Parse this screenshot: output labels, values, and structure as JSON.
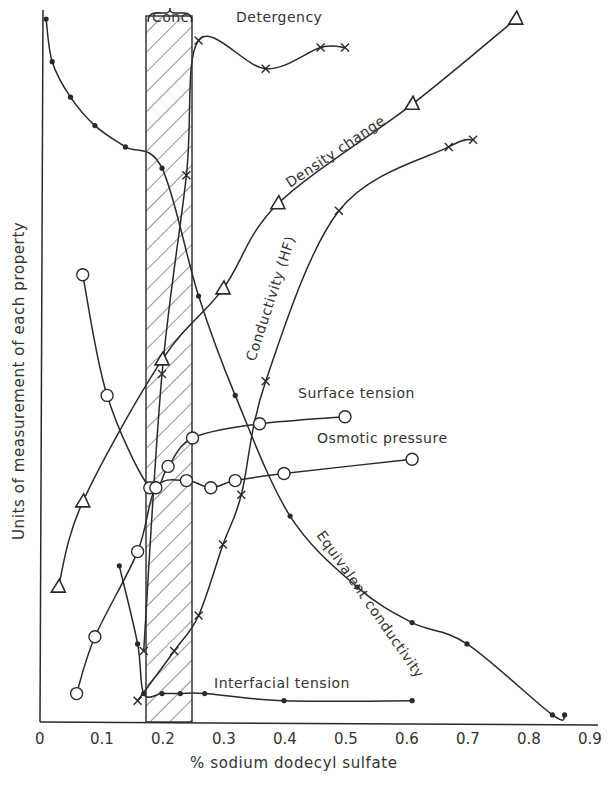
{
  "chart_data": {
    "type": "line",
    "title": "",
    "xlabel": "% sodium dodecyl sulfate",
    "ylabel": "Units of measurement of each property",
    "xlim": [
      0,
      0.9
    ],
    "ylim": [
      0,
      100
    ],
    "x_ticks": [
      "0",
      "0.1",
      "0.2",
      "0.3",
      "0.4",
      "0.5",
      "0.6",
      "0.7",
      "0.8",
      "0.9"
    ],
    "y_ticks": [],
    "grid": false,
    "legend": "inline curve labels",
    "annotations": [
      {
        "text": "Conc.",
        "type": "bracket",
        "x_range": [
          0.17,
          0.25
        ],
        "note": "hatched critical micelle concentration band"
      }
    ],
    "series": [
      {
        "name": "Detergency",
        "marker": "x",
        "x": [
          0.17,
          0.2,
          0.24,
          0.26,
          0.37,
          0.46,
          0.5
        ],
        "y": [
          10,
          49,
          77,
          96,
          92,
          95,
          95
        ]
      },
      {
        "name": "Density change",
        "marker": "triangle",
        "x": [
          0.03,
          0.07,
          0.2,
          0.3,
          0.39,
          0.61,
          0.78
        ],
        "y": [
          19,
          31,
          51,
          61,
          73,
          87,
          99
        ]
      },
      {
        "name": "Conductivity (HF)",
        "marker": "x",
        "x": [
          0.16,
          0.22,
          0.26,
          0.3,
          0.33,
          0.37,
          0.49,
          0.67,
          0.71
        ],
        "y": [
          3,
          10,
          15,
          25,
          32,
          48,
          72,
          81,
          82
        ]
      },
      {
        "name": "Surface tension",
        "marker": "circle",
        "x": [
          0.07,
          0.11,
          0.18,
          0.21,
          0.25,
          0.36,
          0.5
        ],
        "y": [
          63,
          46,
          33,
          36,
          40,
          42,
          43
        ]
      },
      {
        "name": "Osmotic pressure",
        "marker": "circle",
        "x": [
          0.06,
          0.09,
          0.16,
          0.19,
          0.24,
          0.28,
          0.32,
          0.4,
          0.61
        ],
        "y": [
          4,
          12,
          24,
          33,
          34,
          33,
          34,
          35,
          37
        ]
      },
      {
        "name": "Equivalent conductivity",
        "marker": "dot",
        "x": [
          0.01,
          0.02,
          0.05,
          0.09,
          0.14,
          0.2,
          0.26,
          0.32,
          0.41,
          0.52,
          0.61,
          0.7,
          0.84,
          0.86
        ],
        "y": [
          99,
          93,
          88,
          84,
          81,
          78,
          60,
          46,
          29,
          19,
          14,
          11,
          1,
          1
        ]
      },
      {
        "name": "Interfacial tension",
        "marker": "dot",
        "x": [
          0.13,
          0.16,
          0.17,
          0.2,
          0.23,
          0.27,
          0.4,
          0.61
        ],
        "y": [
          22,
          11,
          4,
          4,
          4,
          4,
          3,
          3
        ]
      }
    ]
  },
  "labels": {
    "conc": "Conc.",
    "detergency": "Detergency",
    "density": "Density change",
    "conductivity_hf": "Conductivity (HF)",
    "surface_tension": "Surface tension",
    "osmotic_pressure": "Osmotic pressure",
    "equivalent_conductivity": "Equivalent conductivity",
    "interfacial_tension": "Interfacial tension"
  }
}
